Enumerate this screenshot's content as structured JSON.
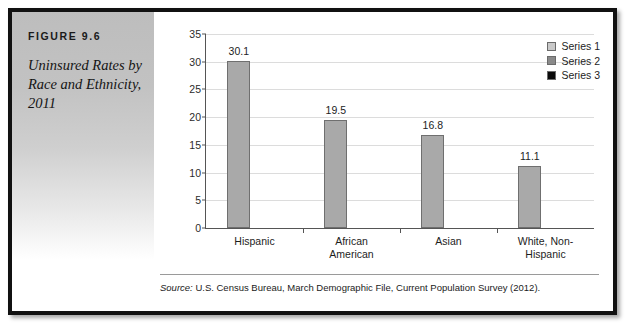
{
  "figure": {
    "number_label": "FIGURE 9.6",
    "title": "Uninsured Rates by Race and Ethnicity, 2011",
    "source_label": "Source:",
    "source_text": " U.S. Census Bureau, March Demographic File, Current Population Survey (2012)."
  },
  "legend": {
    "position": "top-right",
    "entries": [
      {
        "label": "Series 1",
        "color": "#c9c9c9"
      },
      {
        "label": "Series 2",
        "color": "#8a8a8a"
      },
      {
        "label": "Series 3",
        "color": "#0a0a0a"
      }
    ]
  },
  "chart_data": {
    "type": "bar",
    "title": "Uninsured Rates by Race and Ethnicity, 2011",
    "xlabel": "",
    "ylabel": "",
    "categories": [
      "Hispanic",
      "African American",
      "Asian",
      "White, Non-Hispanic"
    ],
    "category_lines": [
      [
        "Hispanic"
      ],
      [
        "African",
        "American"
      ],
      [
        "Asian"
      ],
      [
        "White, Non-",
        "Hispanic"
      ]
    ],
    "series": [
      {
        "name": "Series 1",
        "values": [
          30.1,
          19.5,
          16.8,
          11.1
        ]
      }
    ],
    "values": [
      30.1,
      19.5,
      16.8,
      11.1
    ],
    "value_labels": [
      "30.1",
      "19.5",
      "16.8",
      "11.1"
    ],
    "ylim": [
      0,
      35
    ],
    "ytick_step": 5,
    "yticks": [
      0,
      5,
      10,
      15,
      20,
      25,
      30,
      35
    ],
    "ytick_labels": [
      "0",
      "5",
      "10",
      "15",
      "20",
      "25",
      "30",
      "35"
    ],
    "grid": true,
    "bar_color": "#a9a9a9",
    "bar_border_color": "#6f6f6f",
    "gridline_color": "#dcdcdc",
    "axis_color": "#555555"
  }
}
